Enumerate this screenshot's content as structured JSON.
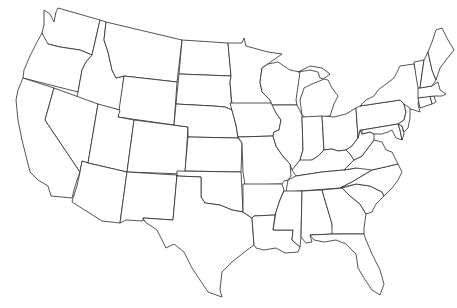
{
  "map": {
    "title": "Blank outline map of the contiguous United States",
    "type": "political-outline",
    "fill_color": "#ffffff",
    "stroke_color": "#2a2a2a",
    "background_color": "#ffffff",
    "labels_visible": false,
    "states": [
      "Washington",
      "Oregon",
      "California",
      "Idaho",
      "Nevada",
      "Montana",
      "Wyoming",
      "Utah",
      "Arizona",
      "Colorado",
      "New Mexico",
      "North Dakota",
      "South Dakota",
      "Nebraska",
      "Kansas",
      "Oklahoma",
      "Texas",
      "Minnesota",
      "Iowa",
      "Missouri",
      "Arkansas",
      "Louisiana",
      "Wisconsin",
      "Illinois",
      "Michigan",
      "Indiana",
      "Ohio",
      "Kentucky",
      "Tennessee",
      "Mississippi",
      "Alabama",
      "Georgia",
      "Florida",
      "South Carolina",
      "North Carolina",
      "Virginia",
      "West Virginia",
      "Pennsylvania",
      "New York",
      "Maryland",
      "Delaware",
      "New Jersey",
      "Connecticut",
      "Rhode Island",
      "Massachusetts",
      "Vermont",
      "New Hampshire",
      "Maine"
    ]
  }
}
